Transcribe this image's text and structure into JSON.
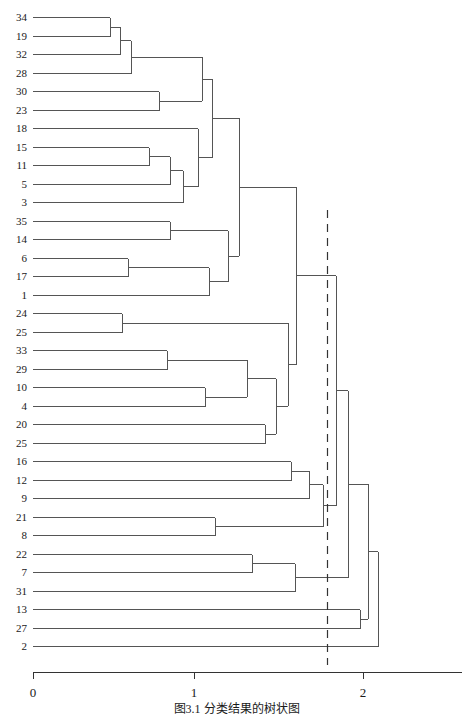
{
  "figure": {
    "type": "dendrogram",
    "caption": "图3.1  分类结果的树状图"
  },
  "axis": {
    "ticks": [
      {
        "value": 0,
        "label": "0",
        "px": 33
      },
      {
        "value": 1,
        "label": "1",
        "px": 194
      },
      {
        "value": 2,
        "label": "2",
        "px": 363
      }
    ],
    "line_y": 672,
    "line_x0": 33,
    "line_x1": 462,
    "color": "#333333"
  },
  "cut_line": {
    "value": 1.83,
    "px": 327,
    "y_top": 210,
    "y_bottom": 665,
    "style": "dashed",
    "color": "#333333"
  },
  "geometry": {
    "x0_px": 33,
    "px_per_unit": 161,
    "first_row_y": 17,
    "row_step": 18.5,
    "line_color": "#555555",
    "line_width": 1
  },
  "chart_data": {
    "type": "dendrogram",
    "title": "图3.1  分类结果的树状图",
    "xlabel": "",
    "ylabel": "",
    "xlim": [
      0,
      2.3
    ],
    "orientation": "horizontal",
    "n_leaves": 35,
    "leaf_order": [
      "34",
      "19",
      "32",
      "28",
      "30",
      "23",
      "18",
      "15",
      "11",
      "5",
      "3",
      "35",
      "14",
      "6",
      "17",
      "1",
      "24",
      "25",
      "33",
      "29",
      "10",
      "4",
      "20",
      "25",
      "16",
      "12",
      "9",
      "21",
      "8",
      "22",
      "7",
      "31",
      "13",
      "27",
      "2"
    ],
    "leaf_rows": [
      {
        "index": 0,
        "label": "34",
        "y": 17
      },
      {
        "index": 1,
        "label": "19",
        "y": 36
      },
      {
        "index": 2,
        "label": "32",
        "y": 54
      },
      {
        "index": 3,
        "label": "28",
        "y": 73
      },
      {
        "index": 4,
        "label": "30",
        "y": 91
      },
      {
        "index": 5,
        "label": "23",
        "y": 110
      },
      {
        "index": 6,
        "label": "18",
        "y": 128
      },
      {
        "index": 7,
        "label": "15",
        "y": 147
      },
      {
        "index": 8,
        "label": "11",
        "y": 165
      },
      {
        "index": 9,
        "label": "5",
        "y": 184
      },
      {
        "index": 10,
        "label": "3",
        "y": 202
      },
      {
        "index": 11,
        "label": "35",
        "y": 221
      },
      {
        "index": 12,
        "label": "14",
        "y": 239
      },
      {
        "index": 13,
        "label": "6",
        "y": 258
      },
      {
        "index": 14,
        "label": "17",
        "y": 276
      },
      {
        "index": 15,
        "label": "1",
        "y": 295
      },
      {
        "index": 16,
        "label": "24",
        "y": 313
      },
      {
        "index": 17,
        "label": "25",
        "y": 332
      },
      {
        "index": 18,
        "label": "33",
        "y": 350
      },
      {
        "index": 19,
        "label": "29",
        "y": 369
      },
      {
        "index": 20,
        "label": "10",
        "y": 387
      },
      {
        "index": 21,
        "label": "4",
        "y": 406
      },
      {
        "index": 22,
        "label": "20",
        "y": 424
      },
      {
        "index": 23,
        "label": "25",
        "y": 443
      },
      {
        "index": 24,
        "label": "16",
        "y": 461
      },
      {
        "index": 25,
        "label": "12",
        "y": 480
      },
      {
        "index": 26,
        "label": "9",
        "y": 498
      },
      {
        "index": 27,
        "label": "21",
        "y": 517
      },
      {
        "index": 28,
        "label": "8",
        "y": 535
      },
      {
        "index": 29,
        "label": "22",
        "y": 554
      },
      {
        "index": 30,
        "label": "7",
        "y": 572
      },
      {
        "index": 31,
        "label": "31",
        "y": 591
      },
      {
        "index": 32,
        "label": "13",
        "y": 609
      },
      {
        "index": 33,
        "label": "27",
        "y": 628
      },
      {
        "index": 34,
        "label": "2",
        "y": 646
      }
    ],
    "merges": [
      {
        "id": "m1",
        "left": "L0",
        "right": "L1",
        "height": 0.48,
        "x": 110
      },
      {
        "id": "m2",
        "left": "m1",
        "right": "L2",
        "height": 0.54,
        "x": 120
      },
      {
        "id": "m3",
        "left": "m2",
        "right": "L3",
        "height": 0.61,
        "x": 131
      },
      {
        "id": "m4",
        "left": "L4",
        "right": "L5",
        "height": 0.78,
        "x": 159
      },
      {
        "id": "m5",
        "left": "L7",
        "right": "L8",
        "height": 0.72,
        "x": 149
      },
      {
        "id": "m6",
        "left": "m5",
        "right": "L9",
        "height": 0.85,
        "x": 170
      },
      {
        "id": "m7",
        "left": "m6",
        "right": "L10",
        "height": 0.93,
        "x": 183
      },
      {
        "id": "m8",
        "left": "m7",
        "right": "L6",
        "height": 1.02,
        "x": 198
      },
      {
        "id": "m9",
        "left": "m3",
        "right": "m4",
        "height": 1.05,
        "x": 202
      },
      {
        "id": "m10",
        "left": "L11",
        "right": "L12",
        "height": 0.85,
        "x": 170
      },
      {
        "id": "m11",
        "left": "L13",
        "right": "L14",
        "height": 0.59,
        "x": 128
      },
      {
        "id": "m12",
        "left": "m11",
        "right": "L15",
        "height": 1.09,
        "x": 209
      },
      {
        "id": "m13",
        "left": "m8",
        "right": "m9",
        "height": 1.11,
        "x": 212
      },
      {
        "id": "m14",
        "left": "m10",
        "right": "m12",
        "height": 1.21,
        "x": 228
      },
      {
        "id": "m15",
        "left": "m13",
        "right": "m14",
        "height": 1.28,
        "x": 239
      },
      {
        "id": "m16",
        "left": "L16",
        "right": "L17",
        "height": 0.55,
        "x": 122
      },
      {
        "id": "m17",
        "left": "L18",
        "right": "L19",
        "height": 0.83,
        "x": 167
      },
      {
        "id": "m18",
        "left": "L20",
        "right": "L21",
        "height": 1.07,
        "x": 205
      },
      {
        "id": "m19",
        "left": "m17",
        "right": "m18",
        "height": 1.33,
        "x": 247
      },
      {
        "id": "m20",
        "left": "L22",
        "right": "L23",
        "height": 1.44,
        "x": 265
      },
      {
        "id": "m21",
        "left": "m19",
        "right": "m20",
        "height": 1.51,
        "x": 276
      },
      {
        "id": "m22",
        "left": "m16",
        "right": "m21",
        "height": 1.58,
        "x": 288
      },
      {
        "id": "m23",
        "left": "m15",
        "right": "m22",
        "height": 1.63,
        "x": 296
      },
      {
        "id": "m24",
        "left": "L24",
        "right": "L25",
        "height": 1.6,
        "x": 291
      },
      {
        "id": "m25",
        "left": "m24",
        "right": "L26",
        "height": 1.71,
        "x": 309
      },
      {
        "id": "m26",
        "left": "L27",
        "right": "L28",
        "height": 1.13,
        "x": 215
      },
      {
        "id": "m27",
        "left": "m25",
        "right": "m26",
        "height": 1.8,
        "x": 323
      },
      {
        "id": "m28",
        "left": "m23",
        "right": "m27",
        "height": 1.88,
        "x": 336
      },
      {
        "id": "m29",
        "left": "L29",
        "right": "L30",
        "height": 1.36,
        "x": 252
      },
      {
        "id": "m30",
        "left": "m29",
        "right": "L31",
        "height": 1.63,
        "x": 295
      },
      {
        "id": "m31",
        "left": "m28",
        "right": "m30",
        "height": 1.96,
        "x": 348
      },
      {
        "id": "m32",
        "left": "L32",
        "right": "L33",
        "height": 2.03,
        "x": 360
      },
      {
        "id": "m33",
        "left": "m31",
        "right": "m32",
        "height": 2.08,
        "x": 368
      },
      {
        "id": "m34",
        "left": "m33",
        "right": "L34",
        "height": 2.14,
        "x": 378
      }
    ]
  }
}
